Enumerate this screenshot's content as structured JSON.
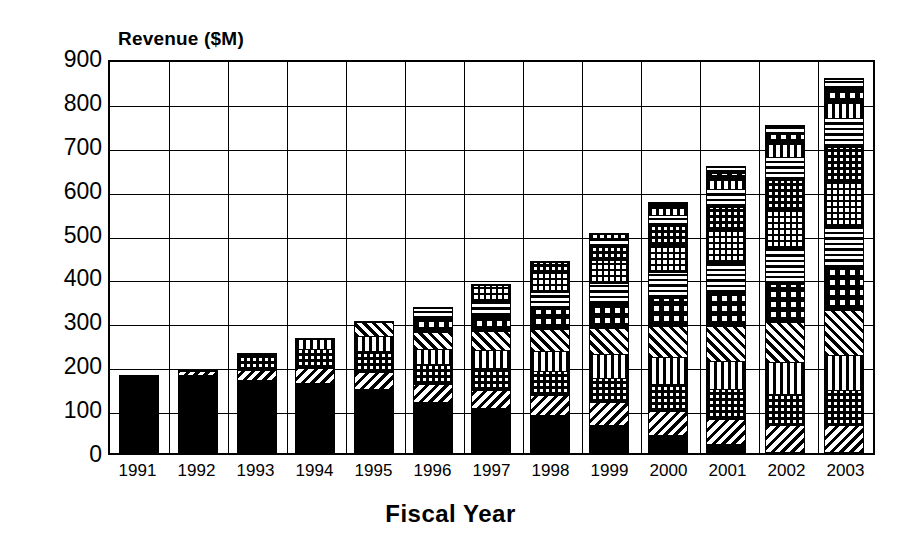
{
  "chart_data": {
    "type": "bar",
    "subtype": "stacked-bar",
    "title": "",
    "ylabel": "Revenue ($M)",
    "xlabel": "Fiscal Year",
    "ylim": [
      0,
      900
    ],
    "ytick_values": [
      900,
      800,
      700,
      600,
      500,
      400,
      300,
      200,
      100,
      0
    ],
    "ytick_labels": [
      "900",
      "800",
      "700",
      "600",
      "500",
      "400",
      "300",
      "200",
      "100",
      "0"
    ],
    "grid": true,
    "grid_axis": "both",
    "legend": "none",
    "categories": [
      "1991",
      "1992",
      "1993",
      "1994",
      "1995",
      "1996",
      "1997",
      "1998",
      "1999",
      "2000",
      "2001",
      "2002",
      "2003"
    ],
    "totals": [
      178,
      190,
      228,
      262,
      300,
      332,
      385,
      437,
      502,
      572,
      655,
      748,
      855
    ],
    "series": [
      {
        "name": "segment-1",
        "pattern": "solid-black",
        "values": [
          178,
          180,
          168,
          160,
          146,
          130,
          113,
          95,
          70,
          44,
          22,
          0,
          0
        ]
      },
      {
        "name": "segment-2",
        "pattern": "diagonal-stripe",
        "values": [
          0,
          10,
          22,
          34,
          40,
          46,
          48,
          52,
          58,
          62,
          66,
          70,
          72
        ]
      },
      {
        "name": "segment-3",
        "pattern": "checker",
        "values": [
          0,
          0,
          38,
          44,
          48,
          52,
          56,
          60,
          64,
          70,
          78,
          88,
          96
        ]
      },
      {
        "name": "segment-4",
        "pattern": "vertical-stripe",
        "values": [
          0,
          0,
          0,
          24,
          34,
          40,
          46,
          52,
          60,
          68,
          76,
          86,
          94
        ]
      },
      {
        "name": "segment-5",
        "pattern": "diagonal-stripe-2",
        "values": [
          0,
          0,
          0,
          0,
          32,
          42,
          50,
          58,
          68,
          80,
          92,
          108,
          122
        ]
      },
      {
        "name": "segment-6",
        "pattern": "checker-big",
        "values": [
          0,
          0,
          0,
          0,
          0,
          34,
          42,
          50,
          62,
          74,
          88,
          104,
          118
        ]
      },
      {
        "name": "segment-7",
        "pattern": "horizontal-stripe",
        "values": [
          0,
          0,
          0,
          0,
          0,
          28,
          36,
          44,
          54,
          66,
          80,
          96,
          110
        ]
      },
      {
        "name": "segment-8",
        "pattern": "grid-fine",
        "values": [
          0,
          0,
          0,
          0,
          0,
          0,
          40,
          48,
          58,
          70,
          86,
          104,
          120
        ]
      },
      {
        "name": "segment-9",
        "pattern": "checker",
        "values": [
          0,
          0,
          0,
          0,
          0,
          0,
          0,
          28,
          36,
          48,
          62,
          80,
          94
        ]
      },
      {
        "name": "segment-10",
        "pattern": "horizontal-stripe",
        "values": [
          0,
          0,
          0,
          0,
          0,
          0,
          0,
          0,
          22,
          30,
          45,
          62,
          79
        ]
      },
      {
        "name": "segment-11",
        "pattern": "vertical-stripe",
        "values": [
          0,
          0,
          0,
          0,
          0,
          0,
          0,
          0,
          10,
          16,
          24,
          34,
          42
        ]
      },
      {
        "name": "segment-12",
        "pattern": "checker-big",
        "values": [
          0,
          0,
          0,
          0,
          0,
          0,
          0,
          0,
          0,
          14,
          20,
          28,
          36
        ]
      },
      {
        "name": "segment-13",
        "pattern": "horizontal-stripe",
        "values": [
          0,
          0,
          0,
          0,
          0,
          0,
          0,
          0,
          0,
          0,
          16,
          22,
          28
        ]
      }
    ]
  },
  "axes": {
    "y_title": "Revenue ($M)",
    "x_title": "Fiscal Year"
  }
}
